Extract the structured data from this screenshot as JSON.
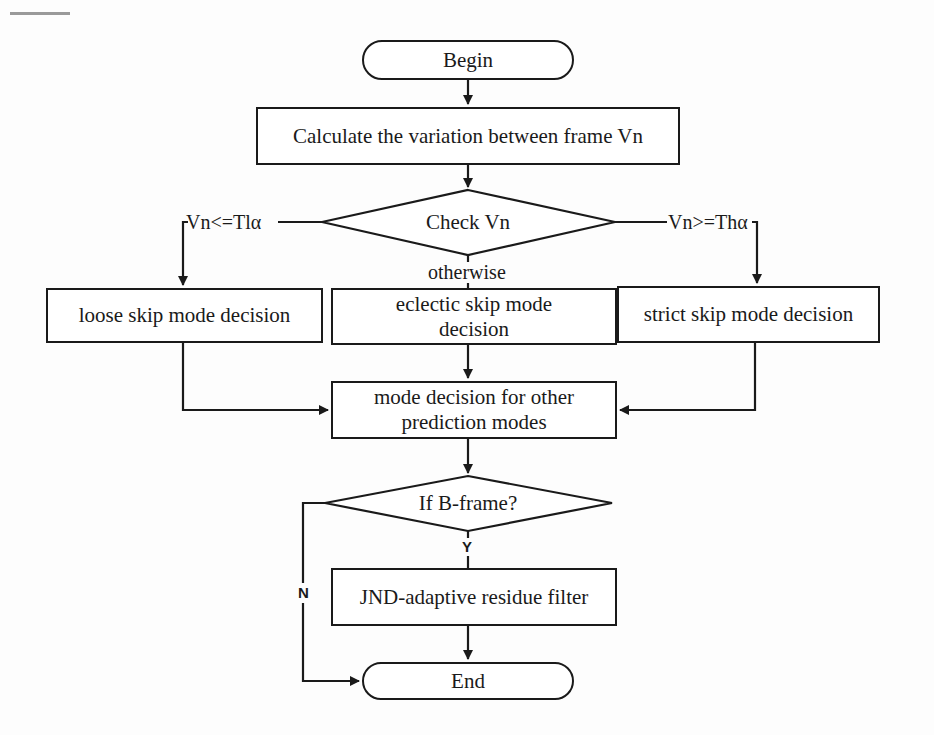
{
  "figure": {
    "type": "flowchart",
    "colors": {
      "stroke": "#1a1a1a",
      "fill": "#ffffff",
      "background": "#fdfdfd"
    },
    "nodes": {
      "begin": {
        "shape": "terminal",
        "text": "Begin"
      },
      "calc": {
        "shape": "process",
        "text": "Calculate the variation between frame Vn"
      },
      "check": {
        "shape": "decision",
        "text": "Check Vn"
      },
      "loose": {
        "shape": "process",
        "text": "loose skip mode decision"
      },
      "eclectic": {
        "shape": "process",
        "line1": "eclectic skip mode",
        "line2": "decision"
      },
      "strict": {
        "shape": "process",
        "text": "strict skip mode decision"
      },
      "mode": {
        "shape": "process",
        "line1": "mode decision for other",
        "line2": "prediction modes"
      },
      "bframe": {
        "shape": "decision",
        "text": "If B-frame?"
      },
      "jnd": {
        "shape": "process",
        "text": "JND-adaptive residue filter"
      },
      "end": {
        "shape": "terminal",
        "text": "End"
      }
    },
    "edge_labels": {
      "low": "Vn<=Tlα",
      "high": "Vn>=Thα",
      "otherwise": "otherwise",
      "yes": "Y",
      "no": "N"
    },
    "edges": [
      {
        "from": "begin",
        "to": "calc"
      },
      {
        "from": "calc",
        "to": "check"
      },
      {
        "from": "check",
        "to": "loose",
        "label": "Vn<=Tlα"
      },
      {
        "from": "check",
        "to": "eclectic",
        "label": "otherwise"
      },
      {
        "from": "check",
        "to": "strict",
        "label": "Vn>=Thα"
      },
      {
        "from": "loose",
        "to": "mode"
      },
      {
        "from": "eclectic",
        "to": "mode"
      },
      {
        "from": "strict",
        "to": "mode"
      },
      {
        "from": "mode",
        "to": "bframe"
      },
      {
        "from": "bframe",
        "to": "jnd",
        "label": "Y"
      },
      {
        "from": "bframe",
        "to": "end",
        "label": "N"
      },
      {
        "from": "jnd",
        "to": "end"
      }
    ]
  }
}
